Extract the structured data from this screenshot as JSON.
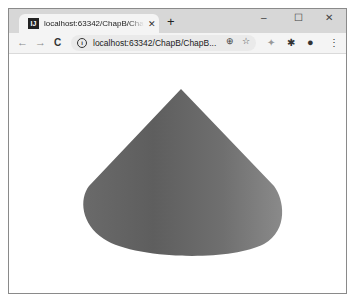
{
  "browser": {
    "tab": {
      "title": "localhost:63342/ChapB/ChapB",
      "favicon": "intellij-icon",
      "close_glyph": "✕"
    },
    "new_tab_glyph": "+",
    "window_controls": {
      "minimize": "–",
      "maximize": "☐",
      "close": "✕"
    },
    "toolbar": {
      "back": "←",
      "forward": "→",
      "reload": "C",
      "info_glyph": "i",
      "url": "localhost:63342/ChapB/ChapB...",
      "zoom_glyph": "⊕",
      "star_glyph": "☆",
      "ext1_glyph": "✦",
      "ext2_glyph": "✱",
      "profile_glyph": "●",
      "menu_glyph": "⋮"
    }
  },
  "content": {
    "shape": "cone",
    "colors": {
      "dark": "#5f5f5f",
      "mid": "#6f6f6f",
      "light": "#8a8a8a"
    }
  }
}
